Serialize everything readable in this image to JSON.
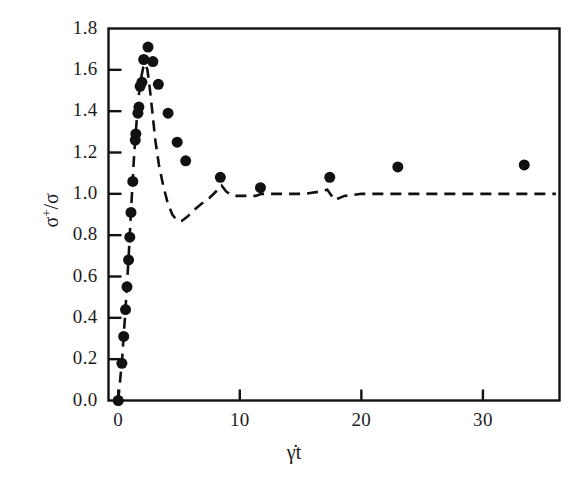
{
  "chart_data": {
    "type": "scatter",
    "title": "",
    "xlabel": "γ̇t",
    "ylabel": "σ⁺/σ",
    "xlim": [
      -0.8,
      36.3
    ],
    "ylim": [
      0.0,
      1.8
    ],
    "xticks": [
      0,
      10,
      20,
      30
    ],
    "xtick_labels": [
      "0",
      "10",
      "20",
      "30"
    ],
    "yticks": [
      0.0,
      0.2,
      0.4,
      0.6,
      0.8,
      1.0,
      1.2,
      1.4,
      1.6,
      1.8
    ],
    "ytick_labels": [
      "0.0",
      "0.2",
      "0.4",
      "0.6",
      "0.8",
      "1.0",
      "1.2",
      "1.4",
      "1.6",
      "1.8"
    ],
    "grid": false,
    "legend": null,
    "frame": "box",
    "tick_direction": "in",
    "series": [
      {
        "name": "experimental data",
        "type": "scatter",
        "marker": "filled-circle",
        "marker_size": 11,
        "color": "#111111",
        "points": [
          [
            0.0,
            0.0
          ],
          [
            0.3,
            0.18
          ],
          [
            0.45,
            0.31
          ],
          [
            0.6,
            0.44
          ],
          [
            0.72,
            0.55
          ],
          [
            0.85,
            0.68
          ],
          [
            0.95,
            0.79
          ],
          [
            1.05,
            0.91
          ],
          [
            1.2,
            1.06
          ],
          [
            1.4,
            1.26
          ],
          [
            1.45,
            1.29
          ],
          [
            1.62,
            1.39
          ],
          [
            1.7,
            1.42
          ],
          [
            1.8,
            1.52
          ],
          [
            1.95,
            1.54
          ],
          [
            2.1,
            1.65
          ],
          [
            2.45,
            1.71
          ],
          [
            2.85,
            1.64
          ],
          [
            3.3,
            1.53
          ],
          [
            4.1,
            1.39
          ],
          [
            4.85,
            1.25
          ],
          [
            5.55,
            1.16
          ],
          [
            8.4,
            1.08
          ],
          [
            11.7,
            1.03
          ],
          [
            17.4,
            1.08
          ],
          [
            23.0,
            1.13
          ],
          [
            33.4,
            1.14
          ]
        ]
      },
      {
        "name": "model prediction",
        "type": "line",
        "linestyle": "dashed",
        "color": "#111111",
        "linewidth": 2.6,
        "points": [
          [
            0.0,
            0.0
          ],
          [
            0.32,
            0.2
          ],
          [
            0.55,
            0.4
          ],
          [
            0.72,
            0.56
          ],
          [
            0.88,
            0.72
          ],
          [
            1.02,
            0.88
          ],
          [
            1.15,
            1.02
          ],
          [
            1.28,
            1.16
          ],
          [
            1.42,
            1.28
          ],
          [
            1.58,
            1.4
          ],
          [
            1.72,
            1.49
          ],
          [
            1.88,
            1.56
          ],
          [
            2.05,
            1.61
          ],
          [
            2.22,
            1.63
          ],
          [
            2.4,
            1.6
          ],
          [
            2.58,
            1.52
          ],
          [
            2.8,
            1.4
          ],
          [
            3.05,
            1.26
          ],
          [
            3.35,
            1.14
          ],
          [
            3.7,
            1.04
          ],
          [
            4.05,
            0.96
          ],
          [
            4.45,
            0.9
          ],
          [
            4.85,
            0.87
          ],
          [
            5.25,
            0.87
          ],
          [
            5.7,
            0.89
          ],
          [
            6.2,
            0.92
          ],
          [
            6.8,
            0.95
          ],
          [
            7.5,
            0.98
          ],
          [
            8.2,
            1.02
          ],
          [
            8.5,
            1.04
          ],
          [
            8.9,
            1.01
          ],
          [
            9.5,
            0.99
          ],
          [
            10.4,
            0.99
          ],
          [
            11.3,
            0.99
          ],
          [
            11.8,
            1.0
          ],
          [
            12.6,
            1.0
          ],
          [
            14.0,
            1.0
          ],
          [
            15.4,
            1.0
          ],
          [
            16.5,
            1.01
          ],
          [
            17.2,
            1.02
          ],
          [
            17.8,
            0.97
          ],
          [
            18.6,
            0.99
          ],
          [
            20.0,
            1.0
          ],
          [
            22.0,
            1.0
          ],
          [
            25.0,
            1.0
          ],
          [
            28.0,
            1.0
          ],
          [
            31.0,
            1.0
          ],
          [
            34.0,
            1.0
          ],
          [
            36.0,
            1.0
          ]
        ]
      }
    ]
  },
  "axis": {
    "y_label_sigma_plus": "σ",
    "y_label_sup": "+",
    "y_label_slash": "/",
    "y_label_sigma": "σ",
    "x_label_text": "γ̇t"
  },
  "colors": {
    "axis": "#111111",
    "marker": "#111111",
    "line": "#111111",
    "background": "#ffffff",
    "tick_text": "#1c1c1c"
  }
}
